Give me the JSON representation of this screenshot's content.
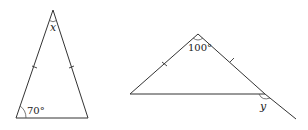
{
  "figures": [
    {
      "name": "isosceles-triangle-left",
      "vertices": {
        "apex": [
          53,
          10
        ],
        "bottom_left": [
          16,
          118
        ],
        "bottom_right": [
          88,
          118
        ]
      },
      "equal_sides_marked": [
        "apex-bottom_left",
        "apex-bottom_right"
      ],
      "labels": {
        "apex_angle": "x",
        "base_angle": "70°"
      }
    },
    {
      "name": "isosceles-triangle-right",
      "vertices": {
        "apex": [
          198,
          34
        ],
        "left": [
          130,
          94
        ],
        "right": [
          265,
          94
        ]
      },
      "extension_end": [
        296,
        119
      ],
      "equal_sides_marked": [
        "apex-left",
        "apex-right"
      ],
      "labels": {
        "apex_angle": "100°",
        "exterior_angle": "y"
      }
    }
  ]
}
